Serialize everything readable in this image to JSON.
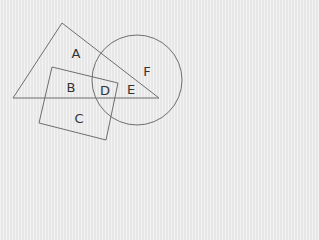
{
  "diagram": {
    "type": "venn-style geometric regions",
    "colors": {
      "background": "#ececec",
      "stroke": "#6e6e6e",
      "text": "#333333"
    },
    "shapes": [
      {
        "name": "triangle",
        "points": [
          [
            62,
            23
          ],
          [
            13,
            98
          ],
          [
            159,
            98
          ]
        ]
      },
      {
        "name": "rectangle",
        "points": [
          [
            52,
            67
          ],
          [
            118,
            83
          ],
          [
            106,
            140
          ],
          [
            39,
            123
          ]
        ]
      },
      {
        "name": "circle",
        "cx": 137,
        "cy": 80,
        "r": 45
      }
    ],
    "labels": [
      {
        "text": "A",
        "x": 76,
        "y": 53
      },
      {
        "text": "B",
        "x": 71,
        "y": 87
      },
      {
        "text": "D",
        "x": 105,
        "y": 90
      },
      {
        "text": "E",
        "x": 131,
        "y": 89
      },
      {
        "text": "F",
        "x": 147,
        "y": 71
      },
      {
        "text": "C",
        "x": 79,
        "y": 118
      }
    ]
  }
}
